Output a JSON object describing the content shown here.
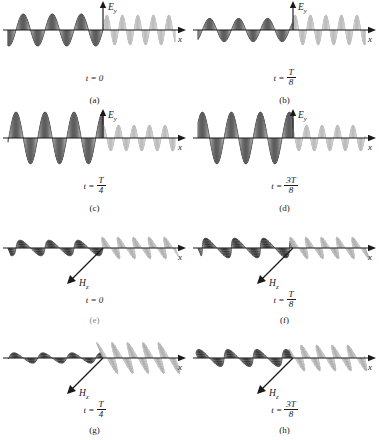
{
  "figure": {
    "background_color": "#ffffff",
    "ink_color": "#1a1a1a",
    "wave_dark_color": "#4a4a4a",
    "wave_light_color": "#c9c9c9"
  },
  "axes": {
    "x_label": "x",
    "e_label": "E",
    "e_sub": "y",
    "h_label": "H",
    "h_sub": "z"
  },
  "panels": [
    {
      "id": "a",
      "letter": "(a)",
      "field": "E",
      "time_text": "t = 0",
      "time_is_fraction": false,
      "time_lhs": "t =",
      "time_num": "",
      "time_den": "",
      "vertical_axis_label": "E",
      "vertical_axis_sub": "y"
    },
    {
      "id": "b",
      "letter": "(b)",
      "field": "E",
      "time_text": "t = T/8",
      "time_is_fraction": true,
      "time_lhs": "t =",
      "time_num": "T",
      "time_den": "8",
      "vertical_axis_label": "E",
      "vertical_axis_sub": "y"
    },
    {
      "id": "c",
      "letter": "(c)",
      "field": "E",
      "time_text": "t = T/4",
      "time_is_fraction": true,
      "time_lhs": "t =",
      "time_num": "T",
      "time_den": "4",
      "vertical_axis_label": "E",
      "vertical_axis_sub": "y"
    },
    {
      "id": "d",
      "letter": "(d)",
      "field": "E",
      "time_text": "t = 3T/8",
      "time_is_fraction": true,
      "time_lhs": "t =",
      "time_num": "3T",
      "time_den": "8",
      "vertical_axis_label": "E",
      "vertical_axis_sub": "y"
    },
    {
      "id": "e",
      "letter": "(e)",
      "field": "H",
      "time_text": "t = 0",
      "time_is_fraction": false,
      "time_lhs": "t =",
      "time_num": "",
      "time_den": "",
      "vertical_axis_label": "H",
      "vertical_axis_sub": "z"
    },
    {
      "id": "f",
      "letter": "(f)",
      "field": "H",
      "time_text": "t = T/8",
      "time_is_fraction": true,
      "time_lhs": "t =",
      "time_num": "T",
      "time_den": "8",
      "vertical_axis_label": "H",
      "vertical_axis_sub": "z"
    },
    {
      "id": "g",
      "letter": "(g)",
      "field": "H",
      "time_text": "t = T/4",
      "time_is_fraction": true,
      "time_lhs": "t =",
      "time_num": "T",
      "time_den": "4",
      "vertical_axis_label": "H",
      "vertical_axis_sub": "z"
    },
    {
      "id": "h",
      "letter": "(h)",
      "field": "H",
      "time_text": "t = 3T/8",
      "time_is_fraction": true,
      "time_lhs": "t =",
      "time_num": "3T",
      "time_den": "8",
      "vertical_axis_label": "H",
      "vertical_axis_sub": "z"
    }
  ],
  "chart_data": {
    "type": "line",
    "xlabel": "x",
    "ylabel": "E_y (panels a-d), H_z (panels e-h)",
    "grid": false,
    "legend": "none",
    "x_origin_fraction": 0.545,
    "regions": [
      {
        "name": "left",
        "x_range": [
          -5.2,
          0
        ],
        "wavelength": 1.72,
        "shade": "dark",
        "cycles": 3
      },
      {
        "name": "right",
        "x_range": [
          0,
          4.6
        ],
        "wavelength": 0.92,
        "shade": "light",
        "cycles": 5
      }
    ],
    "series": [
      {
        "name": "a: E_y at t = 0",
        "panel": "a",
        "left_amplitude": 0.62,
        "right_amplitude": 0.58,
        "left_phase_deg": 0,
        "right_phase_deg": 0
      },
      {
        "name": "b: E_y at t = T/8",
        "panel": "b",
        "left_amplitude": 0.45,
        "right_amplitude": 0.58,
        "left_phase_deg": 45,
        "right_phase_deg": 45
      },
      {
        "name": "c: E_y at t = T/4",
        "panel": "c",
        "left_amplitude": 1.0,
        "right_amplitude": 0.5,
        "left_phase_deg": 90,
        "right_phase_deg": 90
      },
      {
        "name": "d: E_y at t = 3T/8",
        "panel": "d",
        "left_amplitude": 1.0,
        "right_amplitude": 0.5,
        "left_phase_deg": 135,
        "right_phase_deg": 135
      },
      {
        "name": "e: H_z at t = 0",
        "panel": "e",
        "left_amplitude": 0.3,
        "right_amplitude": 0.42,
        "left_phase_deg": 0,
        "right_phase_deg": 0
      },
      {
        "name": "f: H_z at t = T/8",
        "panel": "f",
        "left_amplitude": 0.38,
        "right_amplitude": 0.42,
        "left_phase_deg": 45,
        "right_phase_deg": 45
      },
      {
        "name": "g: H_z at t = T/4",
        "panel": "g",
        "left_amplitude": 0.2,
        "right_amplitude": 0.6,
        "left_phase_deg": 90,
        "right_phase_deg": 90
      },
      {
        "name": "h: H_z at t = 3T/8",
        "panel": "h",
        "left_amplitude": 0.33,
        "right_amplitude": 0.5,
        "left_phase_deg": 135,
        "right_phase_deg": 135
      }
    ]
  }
}
